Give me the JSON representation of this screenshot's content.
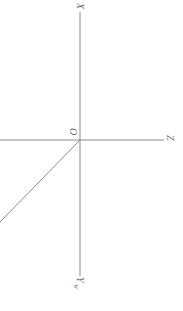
{
  "diagram": {
    "type": "projection-axes",
    "rotation_deg": 90,
    "colors": {
      "line": "#8a8a8a",
      "label": "#666666",
      "background": "#ffffff"
    },
    "origin": {
      "label": "O",
      "x": 80,
      "y": 140
    },
    "axes": [
      {
        "id": "x",
        "label": "X",
        "sub": "",
        "from": [
          80,
          140
        ],
        "to": [
          80,
          10
        ]
      },
      {
        "id": "z",
        "label": "Z",
        "sub": "",
        "from": [
          80,
          140
        ],
        "to": [
          163,
          140
        ]
      },
      {
        "id": "yw",
        "label": "Y",
        "sub": "W",
        "from": [
          80,
          140
        ],
        "to": [
          80,
          276
        ]
      },
      {
        "id": "left",
        "label": "",
        "sub": "",
        "from": [
          80,
          140
        ],
        "to": [
          0,
          140
        ]
      },
      {
        "id": "diag",
        "label": "",
        "sub": "",
        "from": [
          80,
          140
        ],
        "to": [
          0,
          222
        ]
      }
    ]
  }
}
